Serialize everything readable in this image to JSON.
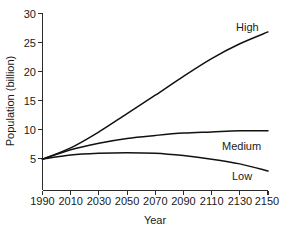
{
  "chart_data": {
    "type": "line",
    "title": "",
    "xlabel": "Year",
    "ylabel": "Population (billion)",
    "xlim": [
      1990,
      2150
    ],
    "ylim": [
      0,
      30
    ],
    "grid": false,
    "legend_position": "inline-right-end-labels",
    "xticks": [
      1990,
      2010,
      2030,
      2050,
      2070,
      2090,
      2110,
      2130,
      2150
    ],
    "xtick_labels": [
      "1990",
      "2010",
      "2030",
      "2050",
      "2070",
      "2090",
      "2110",
      "2130",
      "2150"
    ],
    "yticks": [
      5,
      10,
      15,
      20,
      25,
      30
    ],
    "ytick_labels": [
      "5",
      "10",
      "15",
      "20",
      "25",
      "30"
    ],
    "x": [
      1990,
      2010,
      2030,
      2050,
      2070,
      2090,
      2110,
      2130,
      2150
    ],
    "series": [
      {
        "name": "High",
        "label": "High",
        "color": "#111111",
        "values": [
          5.3,
          7.2,
          9.9,
          13.0,
          16.1,
          19.3,
          22.3,
          24.8,
          26.8
        ]
      },
      {
        "name": "Medium",
        "label": "Medium",
        "color": "#111111",
        "values": [
          5.3,
          6.9,
          8.0,
          8.8,
          9.3,
          9.7,
          9.9,
          10.1,
          10.1
        ]
      },
      {
        "name": "Low",
        "label": "Low",
        "color": "#111111",
        "values": [
          5.3,
          6.0,
          6.3,
          6.4,
          6.3,
          5.9,
          5.3,
          4.5,
          3.3
        ]
      }
    ],
    "annotations": [
      {
        "text": "High",
        "x": 2150,
        "y": 28.5
      },
      {
        "text": "Medium",
        "x": 2150,
        "y": 7.8
      },
      {
        "text": "Low",
        "x": 2140,
        "y": 2.6
      }
    ]
  }
}
